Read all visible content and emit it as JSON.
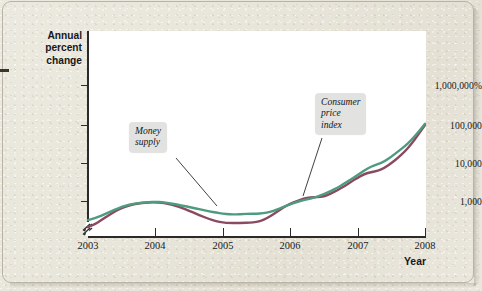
{
  "figure": {
    "background_color": "#e8e5da",
    "plot_background_color": "#ffffff"
  },
  "axes": {
    "y_title": "Annual\npercent\nchange",
    "x_title": "Year",
    "y_tick_labels": [
      "1,000,000%",
      "100,000",
      "10,000",
      "1,000"
    ],
    "x_tick_labels": [
      "2003",
      "2004",
      "2005",
      "2006",
      "2007",
      "2008"
    ],
    "axis_break": true
  },
  "annotations": [
    {
      "id": "money-supply",
      "text": "Money\nsupply"
    },
    {
      "id": "consumer-price-index",
      "text": "Consumer\nprice\nindex"
    }
  ],
  "colors": {
    "money_supply": "#4e9b7d",
    "consumer_price_index": "#8a4a60",
    "axis": "#2b2b2b",
    "callout_background": "#e2e3e0",
    "paper": "#e8e5da"
  },
  "chart_data": {
    "type": "line",
    "title": "",
    "xlabel": "Year",
    "ylabel": "Annual percent change",
    "yscale": "log",
    "ylim": [
      100,
      10000000
    ],
    "xlim": [
      2003,
      2008
    ],
    "grid": false,
    "legend": "annotations-inline",
    "ytick_values": [
      1000000,
      100000,
      10000,
      1000
    ],
    "ytick_labels": [
      "1,000,000%",
      "100,000",
      "10,000",
      "1,000"
    ],
    "xtick_values": [
      2003,
      2004,
      2005,
      2006,
      2007,
      2008
    ],
    "x": [
      2003.0,
      2003.1,
      2003.2,
      2003.3,
      2003.4,
      2003.5,
      2003.6,
      2003.7,
      2003.8,
      2003.9,
      2004.0,
      2004.1,
      2004.2,
      2004.3,
      2004.4,
      2004.5,
      2004.6,
      2004.7,
      2004.8,
      2004.9,
      2005.0,
      2005.1,
      2005.2,
      2005.3,
      2005.4,
      2005.5,
      2005.6,
      2005.7,
      2005.8,
      2005.9,
      2006.0,
      2006.1,
      2006.2,
      2006.3,
      2006.4,
      2006.5,
      2006.6,
      2006.7,
      2006.8,
      2006.9,
      2007.0,
      2007.1,
      2007.2,
      2007.3,
      2007.4,
      2007.5,
      2007.6,
      2007.7,
      2007.8,
      2007.9,
      2008.0
    ],
    "series": [
      {
        "name": "Money supply",
        "color": "#4e9b7d",
        "values": [
          320,
          360,
          420,
          500,
          600,
          700,
          790,
          860,
          900,
          930,
          950,
          930,
          880,
          820,
          760,
          700,
          640,
          590,
          540,
          500,
          470,
          450,
          450,
          460,
          470,
          470,
          480,
          520,
          600,
          700,
          820,
          950,
          1050,
          1150,
          1300,
          1500,
          1800,
          2200,
          2800,
          3600,
          4700,
          6200,
          7800,
          9000,
          10500,
          14000,
          19000,
          26000,
          38000,
          60000,
          100000
        ]
      },
      {
        "name": "Consumer price index",
        "color": "#8a4a60",
        "values": [
          210,
          250,
          320,
          420,
          540,
          660,
          760,
          840,
          890,
          920,
          930,
          900,
          840,
          760,
          660,
          560,
          470,
          400,
          340,
          300,
          275,
          270,
          270,
          272,
          275,
          285,
          320,
          400,
          520,
          680,
          860,
          1000,
          1150,
          1250,
          1250,
          1300,
          1550,
          1900,
          2400,
          3100,
          4000,
          5000,
          5600,
          6000,
          7200,
          9500,
          13000,
          19000,
          30000,
          52000,
          92000
        ]
      }
    ]
  }
}
